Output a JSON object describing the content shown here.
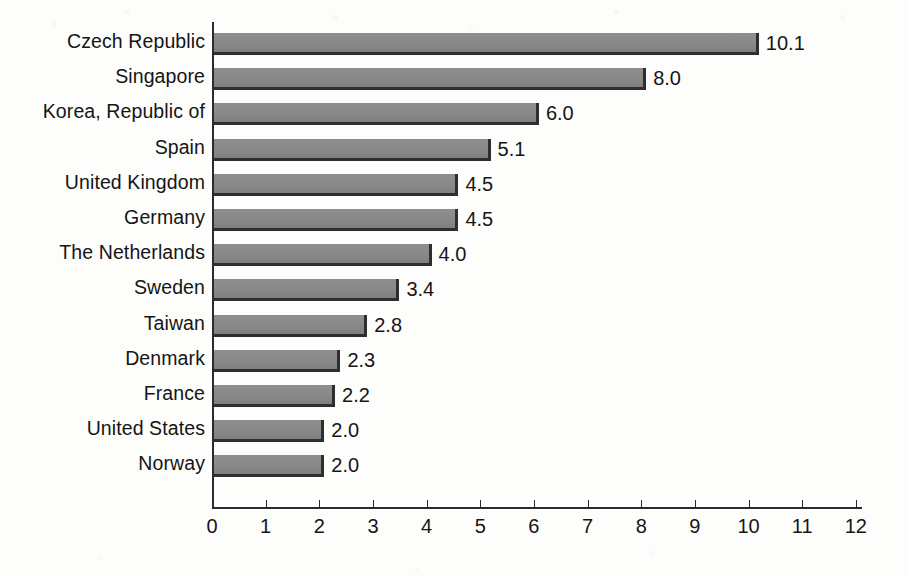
{
  "chart_data": {
    "type": "bar",
    "orientation": "horizontal",
    "title": "",
    "subtitle": "",
    "xlabel": "",
    "ylabel": "",
    "xlim": [
      0,
      12
    ],
    "xticks": [
      0,
      1,
      2,
      3,
      4,
      5,
      6,
      7,
      8,
      9,
      10,
      11,
      12
    ],
    "xtick_labels": [
      "0",
      "1",
      "2",
      "3",
      "4",
      "5",
      "6",
      "7",
      "8",
      "9",
      "10",
      "11",
      "12"
    ],
    "grid": false,
    "legend": null,
    "categories": [
      "Czech Republic",
      "Singapore",
      "Korea, Republic of",
      "Spain",
      "United Kingdom",
      "Germany",
      "The Netherlands",
      "Sweden",
      "Taiwan",
      "Denmark",
      "France",
      "United States",
      "Norway"
    ],
    "values": [
      10.1,
      8.0,
      6.0,
      5.1,
      4.5,
      4.5,
      4.0,
      3.4,
      2.8,
      2.3,
      2.2,
      2.0,
      2.0
    ],
    "value_labels": [
      "10.1",
      "8.0",
      "6.0",
      "5.1",
      "4.5",
      "4.5",
      "4.0",
      "3.4",
      "2.8",
      "2.3",
      "2.2",
      "2.0",
      "2.0"
    ],
    "colors": {
      "bar_fill": "#8a8a8a",
      "bar_shadow": "#2e2e2e",
      "axis": "#2b2b2b",
      "text": "#151515",
      "background": "#fdfdfc"
    }
  }
}
